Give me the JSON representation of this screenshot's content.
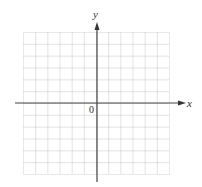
{
  "diagram": {
    "type": "coordinate-grid",
    "axes": {
      "x_label": "x",
      "y_label": "y",
      "origin_label": "0"
    },
    "grid": {
      "columns": 12,
      "rows": 12,
      "left_cells": 6,
      "right_cells": 6,
      "above_cells": 6,
      "below_cells": 6,
      "line_style": "dotted"
    },
    "colors": {
      "grid": "#b8b8b8",
      "axis": "#444444",
      "text": "#333333",
      "background": "#ffffff"
    }
  }
}
